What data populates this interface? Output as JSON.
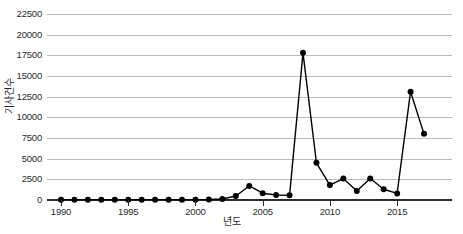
{
  "chart_data": {
    "type": "line",
    "title": "",
    "xlabel": "년도",
    "ylabel": "기사건수",
    "xlim": [
      1990,
      2017
    ],
    "ylim": [
      0,
      22500
    ],
    "grid": true,
    "legend": "none",
    "marker": "filled-circle",
    "line_color": "#000000",
    "grid_color": "#b9b9b9",
    "axis_color": "#2b2b2b",
    "background_color": "#ffffff",
    "xticks": [
      1990,
      1995,
      2000,
      2005,
      2010,
      2015
    ],
    "xtick_labels": [
      "1990",
      "1995",
      "2000",
      "2005",
      "2010",
      "2015"
    ],
    "yticks": [
      0,
      2500,
      5000,
      7500,
      10000,
      12500,
      15000,
      17500,
      20000,
      22500
    ],
    "ytick_labels": [
      "0",
      "2500",
      "5000",
      "7500",
      "10000",
      "12500",
      "15000",
      "17500",
      "20000",
      "22500"
    ],
    "x": [
      1990,
      1991,
      1992,
      1993,
      1994,
      1995,
      1996,
      1997,
      1998,
      1999,
      2000,
      2001,
      2002,
      2003,
      2004,
      2005,
      2006,
      2007,
      2008,
      2009,
      2010,
      2011,
      2012,
      2013,
      2014,
      2015,
      2016,
      2017
    ],
    "values": [
      40,
      40,
      40,
      40,
      40,
      40,
      40,
      40,
      40,
      40,
      40,
      60,
      120,
      480,
      1700,
      820,
      600,
      560,
      17800,
      4500,
      1800,
      2600,
      1100,
      2600,
      1300,
      800,
      13100,
      8000
    ],
    "series": [
      {
        "name": "기사건수",
        "values": [
          40,
          40,
          40,
          40,
          40,
          40,
          40,
          40,
          40,
          40,
          40,
          60,
          120,
          480,
          1700,
          820,
          600,
          560,
          17800,
          4500,
          1800,
          2600,
          1100,
          2600,
          1300,
          800,
          13100,
          8000
        ]
      }
    ]
  }
}
